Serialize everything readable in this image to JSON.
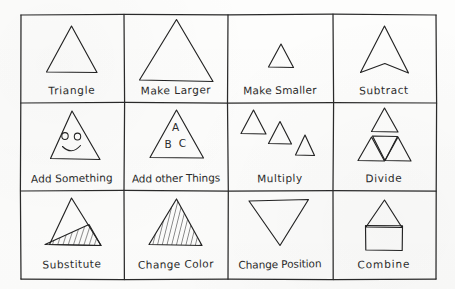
{
  "diagram": {
    "style": {
      "ink_color": "#222222",
      "paper_color": "#fdfdfc",
      "stroke_width": 1.1
    },
    "grid": {
      "columns": 4,
      "rows": 3,
      "left": 20,
      "top": 14,
      "right": 437,
      "bottom": 280
    },
    "cells": [
      {
        "id": "triangle",
        "label": "Triangle",
        "row": 0,
        "column": 0,
        "figure": "plain-upward-triangle"
      },
      {
        "id": "make-larger",
        "label": "Make Larger",
        "row": 0,
        "column": 1,
        "figure": "large-upward-triangle"
      },
      {
        "id": "make-smaller",
        "label": "Make Smaller",
        "row": 0,
        "column": 2,
        "figure": "small-upward-triangle"
      },
      {
        "id": "subtract",
        "label": "Subtract",
        "row": 0,
        "column": 3,
        "figure": "triangle-with-notch-chevron"
      },
      {
        "id": "add-something",
        "label": "Add Something",
        "row": 1,
        "column": 0,
        "figure": "triangle-with-smiley-face"
      },
      {
        "id": "add-other-things",
        "label": "Add other Things",
        "row": 1,
        "column": 1,
        "figure": "triangle-with-letters",
        "letters": [
          "A",
          "B",
          "C"
        ]
      },
      {
        "id": "multiply",
        "label": "Multiply",
        "row": 1,
        "column": 2,
        "figure": "three-descending-triangles"
      },
      {
        "id": "divide",
        "label": "Divide",
        "row": 1,
        "column": 3,
        "figure": "triangle-split-into-four"
      },
      {
        "id": "substitute",
        "label": "Substitute",
        "row": 2,
        "column": 0,
        "figure": "triangle-with-hatched-lower-triangle"
      },
      {
        "id": "change-color",
        "label": "Change Color",
        "row": 2,
        "column": 1,
        "figure": "fully-hatched-triangle"
      },
      {
        "id": "change-position",
        "label": "Change Position",
        "row": 2,
        "column": 2,
        "figure": "inverted-triangle"
      },
      {
        "id": "combine",
        "label": "Combine",
        "row": 2,
        "column": 3,
        "figure": "triangle-on-square-house"
      }
    ]
  }
}
